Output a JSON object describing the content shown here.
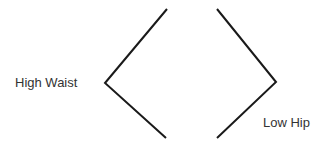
{
  "labels": {
    "left": "High Waist",
    "right": "Low Hip"
  },
  "shapes": {
    "left_chevron": {
      "top": [
        167,
        9
      ],
      "vertex": [
        105,
        83
      ],
      "bottom": [
        166,
        138
      ]
    },
    "right_chevron": {
      "top": [
        217,
        9
      ],
      "vertex": [
        276,
        82
      ],
      "bottom": [
        217,
        138
      ]
    },
    "stroke_color": "#1a1a1a",
    "stroke_width": 2
  }
}
